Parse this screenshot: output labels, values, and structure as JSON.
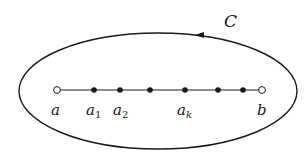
{
  "diagram": {
    "contour": {
      "label": "C",
      "label_pos": [
        229,
        22
      ],
      "center": [
        158,
        91
      ],
      "rx": 139,
      "ry": 58,
      "orientation": "counterclockwise",
      "arrow_pos": [
        201,
        35
      ]
    },
    "segment": {
      "y": 90,
      "x_start": 57,
      "x_end": 262
    },
    "points": [
      {
        "name": "a",
        "x": 57,
        "filled": false,
        "label": "a",
        "sub": ""
      },
      {
        "name": "a1",
        "x": 94,
        "filled": true,
        "label": "a",
        "sub": "1"
      },
      {
        "name": "a2",
        "x": 120,
        "filled": true,
        "label": "a",
        "sub": "2"
      },
      {
        "name": "p4",
        "x": 150,
        "filled": true,
        "label": "",
        "sub": ""
      },
      {
        "name": "ak",
        "x": 185,
        "filled": true,
        "label": "a",
        "sub": "k"
      },
      {
        "name": "p6",
        "x": 218,
        "filled": true,
        "label": "",
        "sub": ""
      },
      {
        "name": "p7",
        "x": 243,
        "filled": true,
        "label": "",
        "sub": ""
      },
      {
        "name": "b",
        "x": 262,
        "filled": false,
        "label": "b",
        "sub": ""
      }
    ],
    "colors": {
      "stroke": "#1a1a1a",
      "background": "#ffffff"
    }
  }
}
